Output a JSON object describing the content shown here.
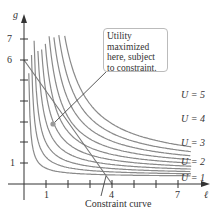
{
  "chart_data": {
    "type": "line",
    "title": "",
    "xlabel": "ℓ",
    "ylabel": "g",
    "x_ticks": [
      1,
      4,
      7
    ],
    "y_ticks": [
      1,
      6,
      7
    ],
    "xlim": [
      0,
      8
    ],
    "ylim": [
      0,
      8
    ],
    "series": [
      {
        "name": "U = 1",
        "form": "indifference curve"
      },
      {
        "name": "U = 2",
        "form": "indifference curve"
      },
      {
        "name": "U = 3",
        "form": "indifference curve"
      },
      {
        "name": "U = 4",
        "form": "indifference curve"
      },
      {
        "name": "U = 5",
        "form": "indifference curve"
      },
      {
        "name": "Constraint curve",
        "x": [
          0,
          4
        ],
        "y": [
          6,
          0
        ]
      }
    ],
    "annotations": [
      {
        "text": "Utility maximized here, subject to constraint.",
        "point": [
          1.3,
          2.9
        ]
      },
      {
        "text": "Constraint curve",
        "point": [
          3.7,
          0.4
        ]
      }
    ]
  },
  "axes": {
    "x_label": "ℓ",
    "y_label": "g",
    "x_ticks": [
      "1",
      "4",
      "7"
    ],
    "y_ticks": [
      "1",
      "6",
      "7"
    ]
  },
  "curve_labels": [
    "U = 1",
    "U = 2",
    "U = 3",
    "U = 4",
    "U = 5"
  ],
  "callout": {
    "line1": "Utility maximized",
    "line2": "here, subject",
    "line3": "to constraint."
  },
  "constraint_label": "Constraint curve",
  "colors": {
    "curve": "#8a8a8a",
    "axis": "#333333",
    "point": "#999999"
  }
}
